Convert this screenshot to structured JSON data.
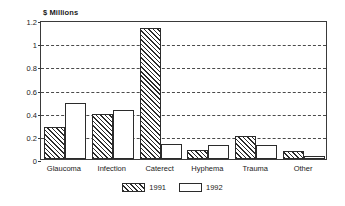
{
  "chart_data": {
    "type": "bar",
    "title": "",
    "ylabel": "$ Millions",
    "xlabel": "",
    "categories": [
      "Glaucoma",
      "Infection",
      "Caterect",
      "Hyphema",
      "Trauma",
      "Other"
    ],
    "series": [
      {
        "name": "1991",
        "values": [
          0.28,
          0.39,
          1.13,
          0.08,
          0.2,
          0.07
        ],
        "fill": "diagonal-hatch"
      },
      {
        "name": "1992",
        "values": [
          0.48,
          0.42,
          0.13,
          0.12,
          0.12,
          0.03
        ],
        "fill": "white"
      }
    ],
    "ylim": [
      0,
      1.2
    ],
    "yticks": [
      0,
      0.2,
      0.4,
      0.6,
      0.8,
      1,
      1.2
    ],
    "ytick_labels": [
      "0",
      "0.2",
      "0.4",
      "0.6",
      "0.8",
      "1",
      "1.2"
    ],
    "grid": true,
    "grid_style": "dashed",
    "legend_position": "bottom-center",
    "colors": {
      "axis": "#3a3a3a",
      "grid": "#4a4a4a",
      "bar_outline": "#2b2b2b",
      "bar_fill_1992": "#ffffff",
      "background": "#ffffff"
    }
  }
}
